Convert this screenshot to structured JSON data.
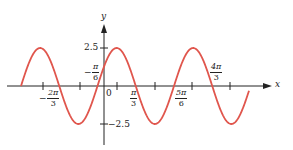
{
  "chart_data": {
    "type": "line",
    "title": "",
    "xlabel": "x",
    "ylabel": "y",
    "function": "y = 2.5 sin(2x + π/3)",
    "amplitude": 2.5,
    "period": "π",
    "ylim": [
      -2.5,
      2.5
    ],
    "y_ticks": [
      {
        "value": 2.5,
        "label": "2.5"
      },
      {
        "value": -2.5,
        "label": "−2.5"
      }
    ],
    "x_labels": [
      {
        "value": "-2π/3",
        "neg": "−",
        "num": "2π",
        "den": "3"
      },
      {
        "value": "-π/6",
        "neg": "−",
        "num": "π",
        "den": "6"
      },
      {
        "value": "0",
        "label": "0"
      },
      {
        "value": "π/3",
        "num": "π",
        "den": "3"
      },
      {
        "value": "5π/6",
        "num": "5π",
        "den": "6"
      },
      {
        "value": "4π/3",
        "num": "4π",
        "den": "3"
      }
    ],
    "zero_crossings": [
      "-2π/3",
      "-π/6",
      "π/3",
      "5π/6",
      "4π/3"
    ],
    "grid": false,
    "legend": null,
    "series": [
      {
        "name": "sinusoid",
        "color": "#e0564d"
      }
    ]
  },
  "labels": {
    "x_axis": "x",
    "y_axis": "y",
    "y_pos": "2.5",
    "y_neg": "−2.5",
    "origin": "0",
    "l1_neg": "−",
    "l1_num": "2π",
    "l1_den": "3",
    "l2_neg": "−",
    "l2_num": "π",
    "l2_den": "6",
    "l3_num": "π",
    "l3_den": "3",
    "l4_num": "5π",
    "l4_den": "6",
    "l5_num": "4π",
    "l5_den": "3"
  },
  "colors": {
    "curve": "#e0564d",
    "axis": "#222222"
  }
}
